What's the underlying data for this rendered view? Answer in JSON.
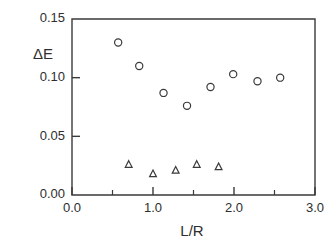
{
  "chart_data": {
    "type": "scatter",
    "title": "",
    "subtitle": "",
    "xlabel": "L/R",
    "ylabel": "ΔE",
    "xlim": [
      0.0,
      3.0
    ],
    "ylim": [
      0.0,
      0.15
    ],
    "grid": false,
    "legend": null,
    "xticks": [
      0.0,
      1.0,
      2.0,
      3.0
    ],
    "xtick_labels": [
      "0.0",
      "1.0",
      "2.0",
      "3.0"
    ],
    "xminor_ticks": [
      0.5,
      1.5,
      2.5
    ],
    "yticks": [
      0.0,
      0.05,
      0.1,
      0.15
    ],
    "ytick_labels": [
      "0.00",
      "0.05",
      "0.10",
      "0.15"
    ],
    "yminor_ticks": [],
    "series": [
      {
        "name": "circles",
        "marker": "open-circle",
        "color": "#3a3a3a",
        "points": [
          {
            "x": 0.57,
            "y": 0.13
          },
          {
            "x": 0.83,
            "y": 0.11
          },
          {
            "x": 1.13,
            "y": 0.087
          },
          {
            "x": 1.42,
            "y": 0.076
          },
          {
            "x": 1.71,
            "y": 0.092
          },
          {
            "x": 1.99,
            "y": 0.103
          },
          {
            "x": 2.29,
            "y": 0.097
          },
          {
            "x": 2.57,
            "y": 0.1
          }
        ]
      },
      {
        "name": "triangles",
        "marker": "open-triangle",
        "color": "#3a3a3a",
        "points": [
          {
            "x": 0.7,
            "y": 0.026
          },
          {
            "x": 1.0,
            "y": 0.018
          },
          {
            "x": 1.28,
            "y": 0.021
          },
          {
            "x": 1.54,
            "y": 0.026
          },
          {
            "x": 1.81,
            "y": 0.024
          }
        ]
      }
    ]
  },
  "axis": {
    "y_title": "ΔE",
    "x_title": "L/R"
  }
}
